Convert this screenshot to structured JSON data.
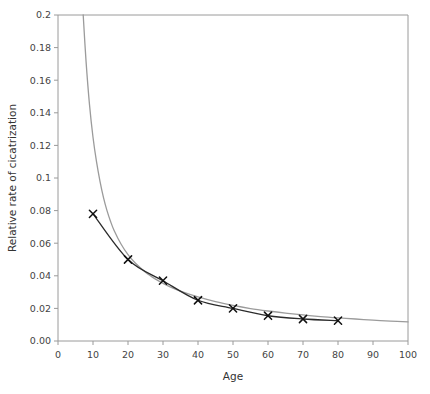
{
  "chart_data": {
    "type": "line",
    "title": "",
    "subtitle": "",
    "xlabel": "Age",
    "ylabel": "Relative rate of  cicatrization",
    "xlim": [
      0,
      100
    ],
    "ylim": [
      0,
      0.2
    ],
    "grid": false,
    "legend": "none",
    "xticks": [
      0,
      10,
      20,
      30,
      40,
      50,
      60,
      70,
      80,
      90,
      100
    ],
    "xtick_labels": [
      "0",
      "10",
      "20",
      "30",
      "40",
      "50",
      "60",
      "70",
      "80",
      "90",
      "100"
    ],
    "yticks": [
      0,
      0.02,
      0.04,
      0.06,
      0.08,
      0.1,
      0.12,
      0.14,
      0.16,
      0.18,
      0.2
    ],
    "ytick_labels": [
      "0.00",
      "0.02",
      "0.04",
      "0.06",
      "0.08",
      "0.1",
      "0.12",
      "0.14",
      "0.16",
      "0.18",
      "0.2"
    ],
    "series": [
      {
        "name": "observed",
        "style": "line-with-x-markers",
        "color": "#2b2b2b",
        "marker": "x",
        "x": [
          10,
          20,
          30,
          40,
          50,
          60,
          70,
          80
        ],
        "values": [
          0.078,
          0.05,
          0.037,
          0.025,
          0.02,
          0.0155,
          0.0135,
          0.0125
        ]
      },
      {
        "name": "fitted-curve",
        "style": "smooth-line",
        "color": "#9b9b9b",
        "marker": "none",
        "x": [
          7.2,
          8,
          9,
          10,
          11,
          12,
          13,
          14,
          15,
          16,
          18,
          20,
          22,
          25,
          28,
          30,
          33,
          36,
          40,
          45,
          50,
          55,
          60,
          65,
          70,
          75,
          80,
          85,
          90,
          95,
          100
        ],
        "values": [
          0.2,
          0.172,
          0.145,
          0.125,
          0.11,
          0.098,
          0.088,
          0.08,
          0.0735,
          0.068,
          0.0595,
          0.053,
          0.048,
          0.0422,
          0.0378,
          0.0354,
          0.0323,
          0.0298,
          0.027,
          0.0241,
          0.0218,
          0.0199,
          0.0184,
          0.0171,
          0.016,
          0.015,
          0.0142,
          0.0135,
          0.0128,
          0.0122,
          0.0117
        ]
      }
    ]
  },
  "figure": {
    "background_color": "#ffffff",
    "axis_color": "#9a9a9a",
    "fit_curve_color": "#9b9b9b",
    "data_curve_color": "#2b2b2b"
  }
}
